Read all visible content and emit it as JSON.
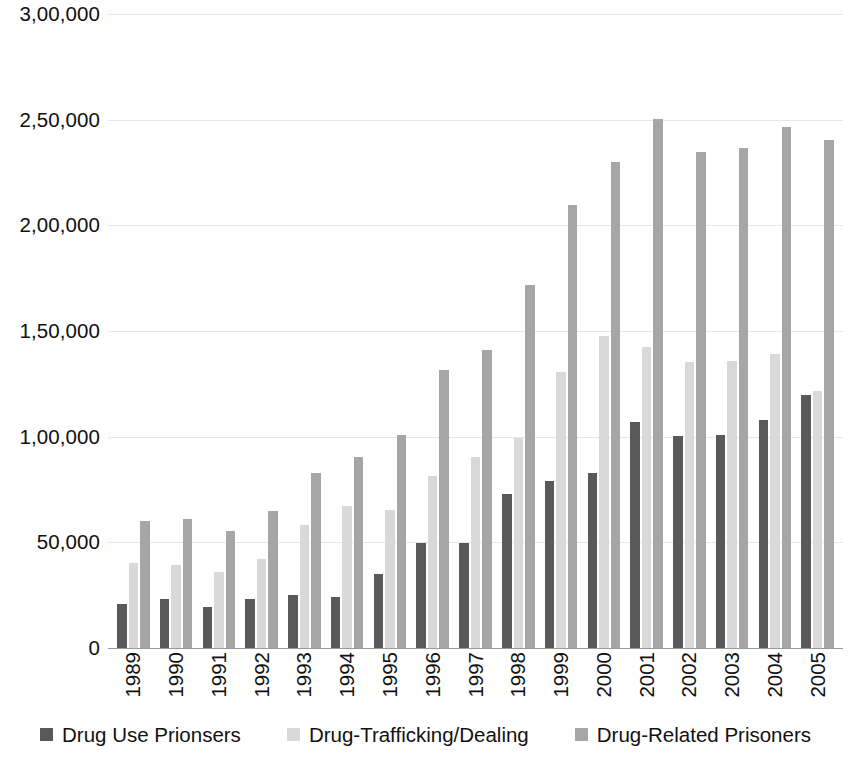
{
  "chart_data": {
    "type": "bar",
    "title": "",
    "subtitle": "",
    "xlabel": "",
    "ylabel": "",
    "grid": true,
    "legend_position": "bottom",
    "ylim": [
      0,
      300000
    ],
    "ytick_labels": [
      "3,00,000",
      "2,50,000",
      "2,00,000",
      "1,50,000",
      "1,00,000",
      "50,000",
      "0"
    ],
    "ytick_values": [
      300000,
      250000,
      200000,
      150000,
      100000,
      50000,
      0
    ],
    "categories": [
      "1989",
      "1990",
      "1991",
      "1992",
      "1993",
      "1994",
      "1995",
      "1996",
      "1997",
      "1998",
      "1999",
      "2000",
      "2001",
      "2002",
      "2003",
      "2004",
      "2005"
    ],
    "series": [
      {
        "name": "Drug Use Prionsers",
        "color": "#595959",
        "values": [
          21000,
          23000,
          19500,
          23000,
          25000,
          24000,
          35000,
          49500,
          49500,
          73000,
          79000,
          83000,
          107000,
          100500,
          101000,
          108000,
          119500
        ]
      },
      {
        "name": "Drug-Trafficking/Dealing",
        "color": "#d9d9d9",
        "values": [
          40000,
          39500,
          36000,
          42000,
          58000,
          67000,
          65500,
          81500,
          90500,
          99500,
          130500,
          147500,
          142500,
          135500,
          136000,
          139000,
          121500
        ]
      },
      {
        "name": "Drug-Related Prisoners",
        "color": "#a6a6a6",
        "values": [
          60000,
          61000,
          55500,
          65000,
          83000,
          90500,
          101000,
          131500,
          141000,
          172000,
          209500,
          230000,
          250500,
          234500,
          236500,
          246500,
          240500
        ]
      }
    ]
  },
  "legend": {
    "items": [
      {
        "label": "Drug Use Prionsers",
        "color": "#595959"
      },
      {
        "label": "Drug-Trafficking/Dealing",
        "color": "#d9d9d9"
      },
      {
        "label": "Drug-Related Prisoners",
        "color": "#a6a6a6"
      }
    ]
  }
}
